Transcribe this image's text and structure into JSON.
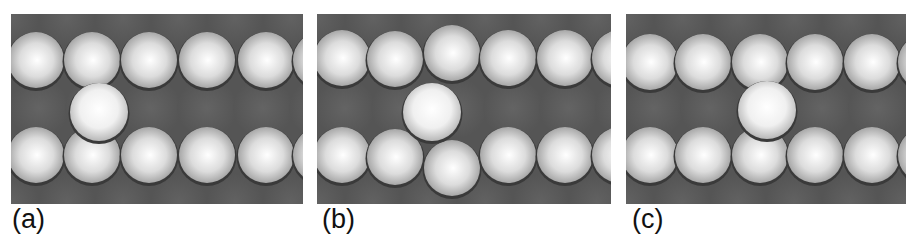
{
  "figure": {
    "panels": [
      {
        "id": "a",
        "label": "(a)",
        "description": "Adatom adsorbed in channel between two close-packed atom rows, shifted left",
        "top_row": [
          {
            "x": 25,
            "y": 46
          },
          {
            "x": 81,
            "y": 46
          },
          {
            "x": 138,
            "y": 46
          },
          {
            "x": 196,
            "y": 46
          },
          {
            "x": 255,
            "y": 46
          },
          {
            "x": 310,
            "y": 46
          }
        ],
        "bottom_row": [
          {
            "x": 25,
            "y": 141
          },
          {
            "x": 81,
            "y": 141
          },
          {
            "x": 138,
            "y": 141
          },
          {
            "x": 196,
            "y": 141
          },
          {
            "x": 255,
            "y": 141
          },
          {
            "x": 310,
            "y": 141
          }
        ],
        "adatom": {
          "x": 88,
          "y": 98
        }
      },
      {
        "id": "b",
        "label": "(b)",
        "description": "Exchange configuration: adatom in channel with displaced row atoms above and below",
        "top_row": [
          {
            "x": 25,
            "y": 44
          },
          {
            "x": 78,
            "y": 45
          },
          {
            "x": 135,
            "y": 39
          },
          {
            "x": 191,
            "y": 44
          },
          {
            "x": 248,
            "y": 44
          },
          {
            "x": 303,
            "y": 44
          }
        ],
        "bottom_row": [
          {
            "x": 25,
            "y": 141
          },
          {
            "x": 78,
            "y": 143
          },
          {
            "x": 135,
            "y": 154
          },
          {
            "x": 191,
            "y": 141
          },
          {
            "x": 248,
            "y": 141
          },
          {
            "x": 303,
            "y": 141
          }
        ],
        "adatom": {
          "x": 115,
          "y": 98
        }
      },
      {
        "id": "c",
        "label": "(c)",
        "description": "Adatom centered in channel between two close-packed rows",
        "top_row": [
          {
            "x": 24,
            "y": 48
          },
          {
            "x": 77,
            "y": 48
          },
          {
            "x": 134,
            "y": 48
          },
          {
            "x": 189,
            "y": 48
          },
          {
            "x": 246,
            "y": 48
          },
          {
            "x": 300,
            "y": 48
          }
        ],
        "bottom_row": [
          {
            "x": 24,
            "y": 141
          },
          {
            "x": 77,
            "y": 141
          },
          {
            "x": 134,
            "y": 141
          },
          {
            "x": 189,
            "y": 141
          },
          {
            "x": 246,
            "y": 141
          },
          {
            "x": 300,
            "y": 141
          }
        ],
        "adatom": {
          "x": 141,
          "y": 96
        }
      }
    ],
    "colors": {
      "substrate": "#555555",
      "substrate_dark": "#3a3a3a",
      "atom_highlight": "#ffffff",
      "atom_shadow": "#9a9a9a",
      "label_text": "#111111"
    }
  }
}
